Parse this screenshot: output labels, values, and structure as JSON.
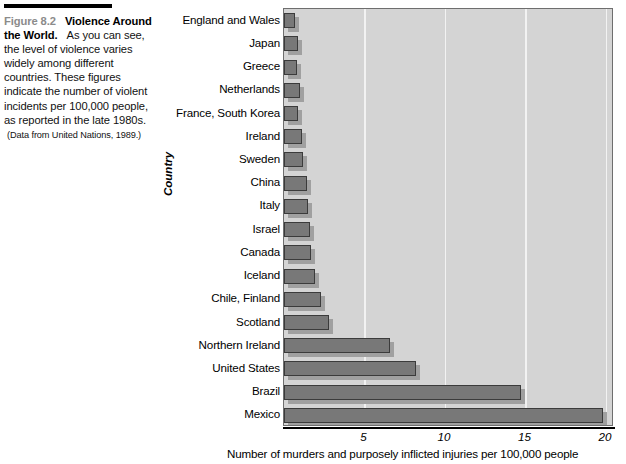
{
  "caption": {
    "figure_number": "Figure 8.2",
    "title": "Violence Around the World.",
    "body": "As you can see, the level of violence varies widely among different countries. These figures indicate the number of violent incidents per 100,000 people, as reported in the late 1980s.",
    "source": "(Data from United Nations, 1989.)"
  },
  "chart_data": {
    "type": "bar",
    "orientation": "horizontal",
    "title": "",
    "xlabel": "Number of murders and purposely inflicted injuries per 100,000 people",
    "ylabel": "Country",
    "xlim": [
      0,
      20.5
    ],
    "xticks": [
      5,
      10,
      15,
      20
    ],
    "xtick_labels": [
      "5",
      "10",
      "15",
      "20"
    ],
    "grid": true,
    "legend": "none",
    "categories": [
      "England and Wales",
      "Japan",
      "Greece",
      "Netherlands",
      "France, South Korea",
      "Ireland",
      "Sweden",
      "China",
      "Italy",
      "Israel",
      "Canada",
      "Iceland",
      "Chile, Finland",
      "Scotland",
      "Northern Ireland",
      "United States",
      "Brazil",
      "Mexico"
    ],
    "values": [
      0.7,
      0.9,
      0.8,
      1.0,
      0.9,
      1.1,
      1.2,
      1.4,
      1.5,
      1.6,
      1.7,
      1.9,
      2.3,
      2.8,
      6.6,
      8.2,
      14.7,
      19.8
    ]
  }
}
